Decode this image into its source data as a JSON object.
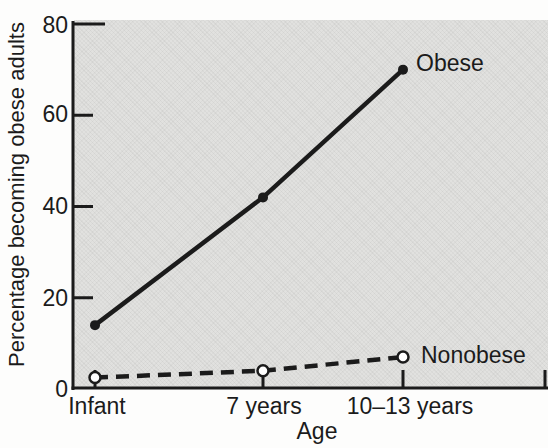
{
  "chart_data": {
    "type": "line",
    "title": "",
    "xlabel": "Age",
    "ylabel": "Percentage becoming obese adults",
    "categories": [
      "Infant",
      "7 years",
      "10–13 years"
    ],
    "ylim": [
      0,
      80
    ],
    "yticks": [
      0,
      20,
      40,
      60,
      80
    ],
    "ytick_labels": [
      "0",
      "20",
      "40",
      "60",
      "80"
    ],
    "grid": false,
    "legend_position": "inline-right-of-last-point",
    "plot_background": "#e1e1df",
    "colors": {
      "ink": "#1b1b1b",
      "open_marker_fill": "#ffffff"
    },
    "series": [
      {
        "name": "Obese",
        "values": [
          14,
          42,
          70
        ],
        "line": "solid",
        "marker": "filled-circle"
      },
      {
        "name": "Nonobese",
        "values": [
          2.5,
          4,
          7
        ],
        "line": "dashed",
        "marker": "open-circle"
      }
    ]
  }
}
